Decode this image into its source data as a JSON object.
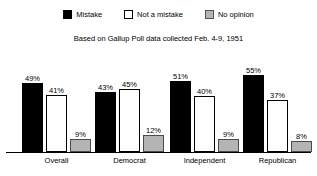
{
  "chart_data": {
    "type": "bar",
    "title": "",
    "subtitle": "Based on Gallup Poll data collected Feb. 4-9, 1951",
    "xlabel": "",
    "ylabel": "",
    "grid": false,
    "legend_position": "top",
    "ylim": [
      0,
      60
    ],
    "value_suffix": "%",
    "categories": [
      "Overall",
      "Democrat",
      "Independent",
      "Republican"
    ],
    "series": [
      {
        "name": "Mistake",
        "color": "#000000",
        "values": [
          49,
          43,
          51,
          55
        ],
        "labels": [
          "49%",
          "43%",
          "51%",
          "55%"
        ]
      },
      {
        "name": "Not a mistake",
        "color": "#ffffff",
        "values": [
          41,
          45,
          40,
          37
        ],
        "labels": [
          "41%",
          "45%",
          "40%",
          "37%"
        ]
      },
      {
        "name": "No opinion",
        "color": "#b4b4b4",
        "values": [
          9,
          12,
          9,
          8
        ],
        "labels": [
          "9%",
          "12%",
          "9%",
          "8%"
        ]
      }
    ]
  },
  "legend": {
    "items": [
      {
        "label": "Mistake",
        "swatch": "legend-swatch-mistake"
      },
      {
        "label": "Not a mistake",
        "swatch": "legend-swatch-not-a-mistake"
      },
      {
        "label": "No opinion",
        "swatch": "legend-swatch-no-opinion"
      }
    ]
  }
}
